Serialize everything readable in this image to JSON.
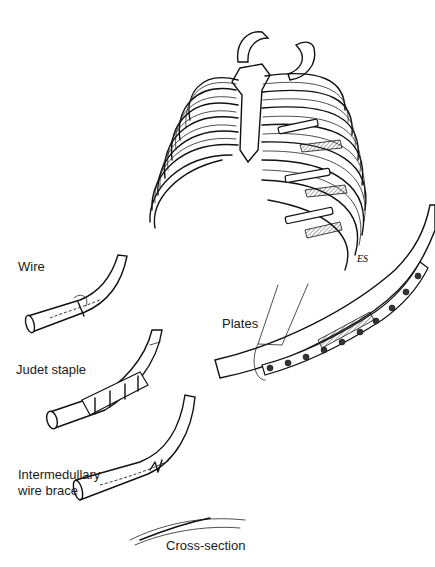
{
  "figure": {
    "labels": {
      "wire": "Wire",
      "judet_staple": "Judet staple",
      "intermedullary_line1": "Intermedullary",
      "intermedullary_line2": "wire brace",
      "plates": "Plates",
      "cross_section": "Cross-section"
    },
    "signature": "ES"
  }
}
